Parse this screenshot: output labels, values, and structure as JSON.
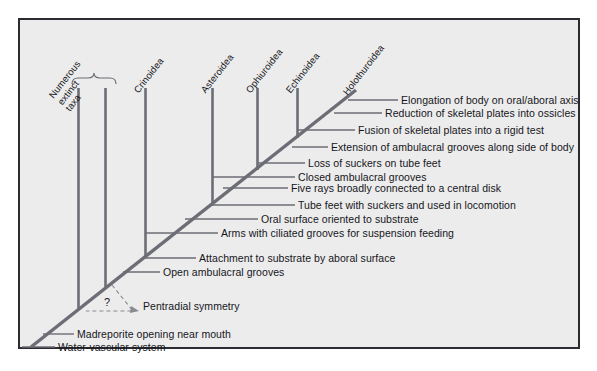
{
  "figure": {
    "background_color": "#ececed",
    "frame_color": "#2b2b31",
    "line_color": "#6d6d75",
    "trunk_color": "#6d6d75",
    "text_color": "#16161a"
  },
  "taxa": [
    {
      "id": "extinct",
      "label": "Numerous extinct taxa",
      "lines": [
        "Numerous",
        "extinct",
        "taxa"
      ],
      "bracketed": true
    },
    {
      "id": "crinoidea",
      "label": "Crinoidea",
      "lines": [
        "Crinoidea"
      ],
      "bracketed": false
    },
    {
      "id": "asteroidea",
      "label": "Asteroidea",
      "lines": [
        "Asteroidea"
      ],
      "bracketed": false
    },
    {
      "id": "ophiuroidea",
      "label": "Ophiuroidea",
      "lines": [
        "Ophiuroidea"
      ],
      "bracketed": false
    },
    {
      "id": "echinoidea",
      "label": "Echinoidea",
      "lines": [
        "Echinoidea"
      ],
      "bracketed": false
    },
    {
      "id": "holothuroidea",
      "label": "Holothuroidea",
      "lines": [
        "Holothuroidea"
      ],
      "bracketed": false
    }
  ],
  "characters": [
    {
      "id": "c1",
      "label": "Elongation of body on oral/aboral axis"
    },
    {
      "id": "c2",
      "label": "Reduction of skeletal plates into ossicles"
    },
    {
      "id": "c3",
      "label": "Fusion of skeletal plates into a rigid test"
    },
    {
      "id": "c4",
      "label": "Extension of ambulacral grooves along side of body"
    },
    {
      "id": "c5",
      "label": "Loss of suckers on tube feet"
    },
    {
      "id": "c6",
      "label": "Closed ambulacral grooves"
    },
    {
      "id": "c7",
      "label": "Five rays broadly connected to a central disk"
    },
    {
      "id": "c8",
      "label": "Tube feet with suckers and used in locomotion"
    },
    {
      "id": "c9",
      "label": "Oral surface oriented to substrate"
    },
    {
      "id": "c10",
      "label": "Arms with ciliated grooves for suspension feeding"
    },
    {
      "id": "c11",
      "label": "Attachment to substrate by aboral surface"
    },
    {
      "id": "c12",
      "label": "Open ambulacral grooves"
    },
    {
      "id": "c13",
      "label": "Pentradial symmetry"
    },
    {
      "id": "c14",
      "label": "Madreporite opening near mouth"
    },
    {
      "id": "c15",
      "label": "Water-vascular system"
    }
  ],
  "annotations": {
    "uncertainty_marker": "?"
  },
  "bottom_crop_text": ""
}
